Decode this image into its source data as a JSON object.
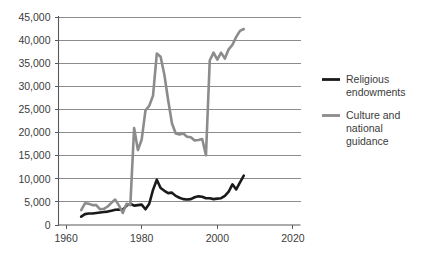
{
  "chart_data": {
    "type": "line",
    "title": "",
    "subtitle": "",
    "xlabel": "",
    "ylabel": "",
    "xlim": [
      1958,
      2022
    ],
    "ylim": [
      0,
      45000
    ],
    "xticks": [
      1960,
      1980,
      2000,
      2020
    ],
    "xtick_labels": [
      "1960",
      "1980",
      "2000",
      "2020"
    ],
    "yticks": [
      0,
      5000,
      10000,
      15000,
      20000,
      25000,
      30000,
      35000,
      40000,
      45000
    ],
    "ytick_labels": [
      "0",
      "5,000",
      "10,000",
      "15,000",
      "20,000",
      "25,000",
      "30,000",
      "35,000",
      "40,000",
      "45,000"
    ],
    "grid": true,
    "grid_axis": "y",
    "legend_position": "right",
    "series": [
      {
        "name": "Religious endowments",
        "color": "#1a1a1a",
        "line_width": 2.6,
        "x": [
          1964,
          1965,
          1966,
          1967,
          1968,
          1969,
          1970,
          1971,
          1972,
          1973,
          1974,
          1975,
          1976,
          1977,
          1978,
          1979,
          1980,
          1981,
          1982,
          1983,
          1984,
          1985,
          1986,
          1987,
          1988,
          1989,
          1990,
          1991,
          1992,
          1993,
          1994,
          1995,
          1996,
          1997,
          1998,
          1999,
          2000,
          2001,
          2002,
          2003,
          2004,
          2005,
          2006,
          2007
        ],
        "y": [
          1800,
          2350,
          2500,
          2500,
          2600,
          2700,
          2800,
          2900,
          3100,
          3300,
          3350,
          3300,
          4200,
          4600,
          4200,
          4300,
          4400,
          3400,
          4600,
          7600,
          9800,
          8000,
          7400,
          6900,
          7000,
          6300,
          5900,
          5600,
          5500,
          5600,
          6000,
          6200,
          6100,
          5800,
          5800,
          5600,
          5700,
          5800,
          6300,
          7200,
          8800,
          7700,
          9200,
          10700
        ]
      },
      {
        "name": "Culture and national guidance",
        "color": "#8c8c8c",
        "line_width": 2.6,
        "x": [
          1964,
          1965,
          1966,
          1967,
          1968,
          1969,
          1970,
          1971,
          1972,
          1973,
          1974,
          1975,
          1976,
          1977,
          1978,
          1979,
          1980,
          1981,
          1982,
          1983,
          1984,
          1985,
          1986,
          1987,
          1988,
          1989,
          1990,
          1991,
          1992,
          1993,
          1994,
          1995,
          1996,
          1997,
          1998,
          1999,
          2000,
          2001,
          2002,
          2003,
          2004,
          2005,
          2006,
          2007
        ],
        "y": [
          3200,
          4700,
          4600,
          4300,
          4300,
          3400,
          3500,
          4000,
          4800,
          5500,
          4200,
          2600,
          4600,
          4300,
          21000,
          16200,
          18500,
          24800,
          25800,
          28000,
          37100,
          36400,
          32500,
          27000,
          22000,
          19800,
          19600,
          19800,
          19100,
          19000,
          18300,
          18400,
          18600,
          15100,
          35600,
          37300,
          35800,
          37300,
          36000,
          38000,
          39000,
          40700,
          42000,
          42400
        ]
      }
    ]
  },
  "legend": {
    "items": [
      {
        "label_line1": "Religious",
        "label_line2": "endowments",
        "label_line3": "",
        "color": "#1a1a1a"
      },
      {
        "label_line1": "Culture and",
        "label_line2": "national",
        "label_line3": "guidance",
        "color": "#8c8c8c"
      }
    ]
  }
}
